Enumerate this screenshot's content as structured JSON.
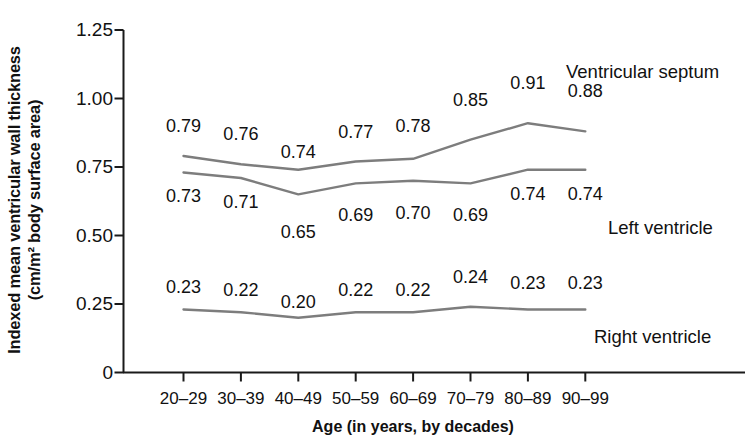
{
  "chart_data": {
    "type": "line",
    "title": "",
    "xlabel": "Age (in years, by decades)",
    "ylabel": "Indexed mean ventricular wall thickness (cm/m² body surface area)",
    "ylabel_line1": "Indexed mean ventricular wall thickness",
    "ylabel_line2": "(cm/m² body surface area)",
    "categories": [
      "20–29",
      "30–39",
      "40–49",
      "50–59",
      "60–69",
      "70–79",
      "80–89",
      "90–99"
    ],
    "ylim": [
      0,
      1.25
    ],
    "yticks": [
      0,
      0.25,
      0.5,
      0.75,
      1.0,
      1.25
    ],
    "ytick_labels": [
      "0",
      "0.25",
      "0.50",
      "0.75",
      "1.00",
      "1.25"
    ],
    "grid": false,
    "legend_position": "inline-right",
    "line_color": "#7d7d7d",
    "axis_color": "#1a1a1a",
    "series": [
      {
        "name": "Ventricular septum",
        "values": [
          0.79,
          0.76,
          0.74,
          0.77,
          0.78,
          0.85,
          0.91,
          0.88
        ],
        "value_labels": [
          "0.79",
          "0.76",
          "0.74",
          "0.77",
          "0.78",
          "0.85",
          "0.91",
          "0.88"
        ],
        "label_offsets": [
          -30,
          -30,
          -18,
          -30,
          -33,
          -40,
          -40,
          -40
        ]
      },
      {
        "name": "Left ventricle",
        "values": [
          0.73,
          0.71,
          0.65,
          0.69,
          0.7,
          0.69,
          0.74,
          0.74
        ],
        "value_labels": [
          "0.73",
          "0.71",
          "0.65",
          "0.69",
          "0.70",
          "0.69",
          "0.74",
          "0.74"
        ],
        "label_offsets": [
          24,
          24,
          38,
          32,
          32,
          32,
          24,
          24
        ]
      },
      {
        "name": "Right ventricle",
        "values": [
          0.23,
          0.22,
          0.2,
          0.22,
          0.22,
          0.24,
          0.23,
          0.23
        ],
        "value_labels": [
          "0.23",
          "0.22",
          "0.20",
          "0.22",
          "0.22",
          "0.24",
          "0.23",
          "0.23"
        ],
        "label_offsets": [
          -22,
          -22,
          -16,
          -22,
          -22,
          -30,
          -26,
          -26
        ]
      }
    ],
    "annotations": [
      {
        "text": "Ventricular septum",
        "x": 566,
        "y": 62
      },
      {
        "text": "Left ventricle",
        "x": 608,
        "y": 218
      },
      {
        "text": "Right ventricle",
        "x": 594,
        "y": 327
      }
    ]
  }
}
